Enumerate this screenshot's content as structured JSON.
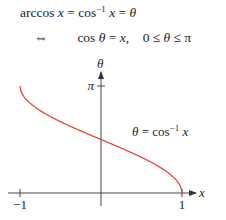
{
  "equations": {
    "line1": {
      "lhs": "arccos",
      "var": "x",
      "eq": "=",
      "cos": "cos",
      "inv": "−1",
      "var2": "x",
      "eq2": "=",
      "theta": "θ"
    },
    "line2": {
      "iff": "⇔",
      "cos": "cos",
      "theta": "θ",
      "eq": "=",
      "var": "x,",
      "range_lo": "0 ≤",
      "range_theta": "θ",
      "range_hi": "≤ π"
    }
  },
  "chart_data": {
    "type": "line",
    "title": "",
    "function": "theta = arccos(x)",
    "xlabel": "x",
    "ylabel": "θ",
    "xlim": [
      -1,
      1
    ],
    "ylim": [
      0,
      3.14159
    ],
    "x_ticks": [
      {
        "value": -1,
        "label": "−1"
      },
      {
        "value": 1,
        "label": "1"
      }
    ],
    "y_ticks": [
      {
        "value": 3.14159,
        "label": "π"
      }
    ],
    "series": [
      {
        "name": "θ = cos⁻¹ x",
        "color": "#e8463c",
        "x": [
          -1,
          -0.9,
          -0.75,
          -0.5,
          -0.25,
          0,
          0.25,
          0.5,
          0.75,
          0.9,
          1
        ],
        "y": [
          3.1416,
          2.6906,
          2.4189,
          2.0944,
          1.8235,
          1.5708,
          1.3181,
          1.0472,
          0.7227,
          0.451,
          0
        ]
      }
    ],
    "annotation": {
      "text_theta": "θ",
      "text_eq": " = cos",
      "text_inv": "−1",
      "text_x": " x"
    },
    "grid": false
  }
}
